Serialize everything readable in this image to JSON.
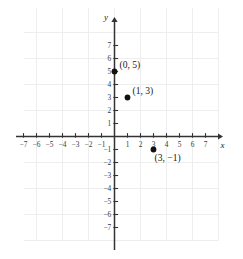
{
  "chart_data": {
    "type": "scatter",
    "title": "",
    "xlabel": "x",
    "ylabel": "y",
    "xlim": [
      -8,
      8
    ],
    "ylim": [
      -8,
      8
    ],
    "grid": true,
    "grid_step": 2,
    "tick_step": 1,
    "x_ticks": [
      -7,
      -6,
      -5,
      -4,
      -3,
      -2,
      -1,
      1,
      2,
      3,
      4,
      5,
      6,
      7
    ],
    "y_ticks": [
      -7,
      -6,
      -5,
      -4,
      -3,
      -2,
      -1,
      1,
      2,
      3,
      4,
      5,
      6,
      7
    ],
    "x_tick_labels": [
      "−7",
      "−6",
      "−5",
      "−4",
      "−3",
      "−2",
      "−1",
      "1",
      "2",
      "3",
      "4",
      "5",
      "6",
      "7"
    ],
    "y_tick_labels": [
      "−7",
      "−6",
      "−5",
      "−4",
      "−3",
      "−2",
      "−1",
      "1",
      "2",
      "3",
      "4",
      "5",
      "6",
      "7"
    ],
    "points": [
      {
        "x": 0,
        "y": 5,
        "label": "(0, 5)",
        "label_dx": 5,
        "label_dy": -4
      },
      {
        "x": 1,
        "y": 3,
        "label": "(1, 3)",
        "label_dx": 5,
        "label_dy": -4
      },
      {
        "x": 3,
        "y": -1,
        "label": "(3, −1)",
        "label_dx": 1,
        "label_dy": 11
      }
    ],
    "legend": null,
    "colors": {
      "point": "#111111",
      "axis": "#333333",
      "grid": "#ececec",
      "text": "#1a1a1a",
      "background": "#ffffff"
    }
  }
}
